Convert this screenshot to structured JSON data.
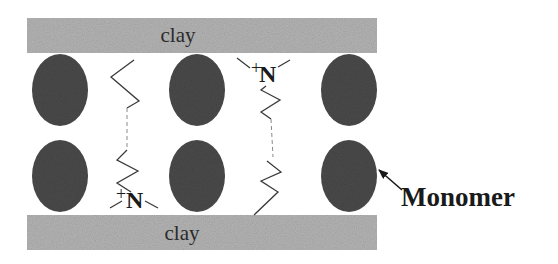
{
  "diagram": {
    "type": "clay-intercalation-schematic",
    "layers": {
      "top": {
        "label": "clay"
      },
      "bottom": {
        "label": "clay"
      }
    },
    "monomer_grid": {
      "rows": 2,
      "columns": 3
    },
    "surfactant_chains": [
      {
        "id": "chain-left",
        "head_group": {
          "charge": "+",
          "atom": "N"
        },
        "head_position": "bottom"
      },
      {
        "id": "chain-right",
        "head_group": {
          "charge": "+",
          "atom": "N"
        },
        "head_position": "top"
      }
    ],
    "callout": {
      "label": "Monomer",
      "target": "monomer-row2-col3"
    },
    "colors": {
      "clay": "#b0b0b0",
      "monomer": "#4a4a4a",
      "chain": "#3a3a3a",
      "text": "#1a1a1a"
    }
  }
}
